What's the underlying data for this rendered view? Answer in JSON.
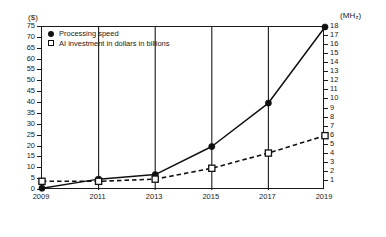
{
  "axes": {
    "left_unit": "($)",
    "right_unit": "(MHz)",
    "right_unit_base": "(MH",
    "right_unit_sub": "z",
    "right_unit_close": ")"
  },
  "legend": {
    "items": [
      {
        "label": "Processing speed",
        "marker": "filled-circle-icon",
        "color": "#111111"
      },
      {
        "label": "AI investment in dollars in billions",
        "marker": "open-square-icon",
        "color": "#111111"
      }
    ]
  },
  "chart_data": {
    "type": "line",
    "title": "",
    "xlabel": "",
    "ylabel": "($)",
    "y2label": "(MHz)",
    "categories": [
      "2009",
      "2011",
      "2013",
      "2015",
      "2017",
      "2019"
    ],
    "x": [
      2009,
      2011,
      2013,
      2015,
      2017,
      2019
    ],
    "ylim": [
      0,
      75
    ],
    "y2lim": [
      0,
      18
    ],
    "yticks": [
      0,
      5,
      10,
      15,
      20,
      25,
      30,
      35,
      40,
      45,
      50,
      55,
      60,
      65,
      70,
      75
    ],
    "y2ticks": [
      1,
      2,
      3,
      4,
      5,
      6,
      7,
      8,
      9,
      10,
      11,
      12,
      13,
      14,
      15,
      16,
      17,
      18
    ],
    "grid": "vertical-only",
    "legend_position": "top-left",
    "series": [
      {
        "name": "Processing speed",
        "axis": "right",
        "unit": "MHz",
        "marker": "filled-circle",
        "line": "solid",
        "color": "#111111",
        "values": [
          0.2,
          1.2,
          1.7,
          4.8,
          9.6,
          18.0
        ],
        "values_left_scale": [
          1,
          5,
          7,
          20,
          40,
          75
        ]
      },
      {
        "name": "AI investment in dollars in billions",
        "axis": "left",
        "unit": "$ billions",
        "marker": "open-square",
        "line": "dashed",
        "color": "#111111",
        "values": [
          4,
          4,
          5,
          10,
          17,
          25
        ]
      }
    ]
  }
}
